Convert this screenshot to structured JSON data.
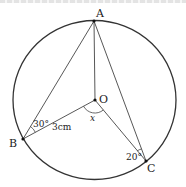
{
  "diagram": {
    "type": "circle-geometry",
    "circle": {
      "center_label": "O"
    },
    "points": [
      {
        "id": "A",
        "label": "A"
      },
      {
        "id": "B",
        "label": "B"
      },
      {
        "id": "C",
        "label": "C"
      },
      {
        "id": "O",
        "label": "O"
      }
    ],
    "segments": [
      "AB",
      "AC",
      "AO",
      "OB",
      "OC"
    ],
    "annotations": {
      "angle_ABO": "30°",
      "length_OB": "3cm",
      "angle_BOC": "x",
      "angle_ACO": "20°"
    },
    "colors": {
      "stroke": "#333333",
      "text": "#222222"
    }
  }
}
